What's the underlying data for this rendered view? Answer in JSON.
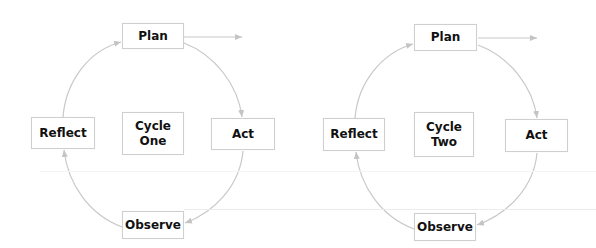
{
  "diagram": {
    "type": "action-research-cycles",
    "line_color": "#c8c8c8",
    "border_color": "#cfcfcf",
    "cycles": [
      {
        "center_label": [
          "Cycle",
          "One"
        ],
        "plan": "Plan",
        "act": "Act",
        "observe": "Observe",
        "reflect": "Reflect"
      },
      {
        "center_label": [
          "Cycle",
          "Two"
        ],
        "plan": "Plan",
        "act": "Act",
        "observe": "Observe",
        "reflect": "Reflect"
      }
    ],
    "flow": [
      "Plan",
      "Act",
      "Observe",
      "Reflect",
      "Plan"
    ]
  }
}
